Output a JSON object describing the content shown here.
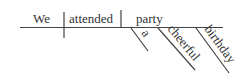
{
  "diagram": {
    "type": "sentence-diagram",
    "sentence": "We attended a cheerful birthday party",
    "subject": "We",
    "verb": "attended",
    "direct_object": "party",
    "modifiers": [
      {
        "word": "a",
        "modifies": "party"
      },
      {
        "word": "cheerful",
        "modifies": "party"
      },
      {
        "word": "birthday",
        "modifies": "party"
      }
    ],
    "colors": {
      "line": "#444444",
      "text": "#333333",
      "background": "#ffffff"
    }
  }
}
